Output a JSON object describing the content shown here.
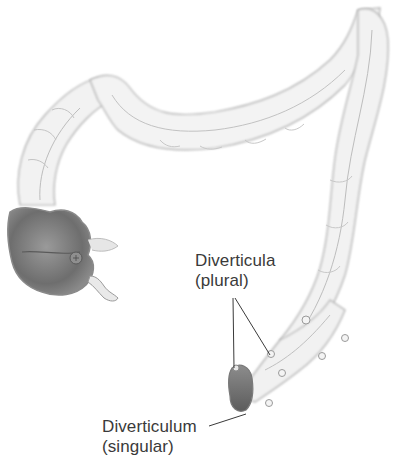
{
  "diagram": {
    "labels": {
      "plural": {
        "term": "Diverticula",
        "qualifier": "(plural)"
      },
      "singular": {
        "term": "Diverticulum",
        "qualifier": "(singular)"
      }
    },
    "colors": {
      "outline": "#9a9a9a",
      "tube_fill": "#f1f1f1",
      "shadow": "#6b6b6b",
      "leader_line": "#3a3a3a",
      "text": "#3a3a3a"
    }
  }
}
